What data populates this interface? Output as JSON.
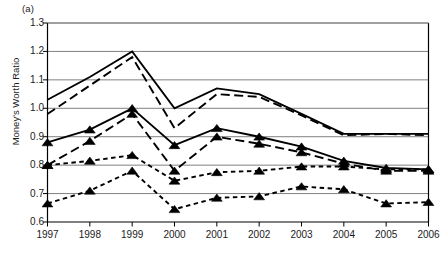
{
  "panel": {
    "label": "(a)"
  },
  "chart_data": {
    "type": "line",
    "title": "",
    "subtitle": "",
    "xlabel": "",
    "ylabel": "Money's Worth Ratio",
    "categories": [
      "1997",
      "1998",
      "1999",
      "2000",
      "2001",
      "2002",
      "2003",
      "2004",
      "2005",
      "2006"
    ],
    "x": [
      1997,
      1998,
      1999,
      2000,
      2001,
      2002,
      2003,
      2004,
      2005,
      2006
    ],
    "ylim": [
      0.6,
      1.3
    ],
    "yticks": [
      0.6,
      0.7,
      0.8,
      0.9,
      1.0,
      1.1,
      1.2,
      1.3
    ],
    "ytick_labels": [
      "0.6",
      "0.7",
      "0.8",
      "0.9",
      "1.0",
      "1.1",
      "1.2",
      "1.3"
    ],
    "xlim": [
      1997,
      2006
    ],
    "grid": "horizontal",
    "legend": "none",
    "line_color": "#000000",
    "grid_color": "#808080",
    "axis_color": "#000000",
    "series": [
      {
        "name": "series-1-top-solid",
        "style": "solid",
        "marker": "none",
        "values": [
          1.03,
          1.11,
          1.2,
          1.0,
          1.07,
          1.05,
          0.98,
          0.91,
          0.91,
          0.91
        ]
      },
      {
        "name": "series-2-top-longdash",
        "style": "long-dash",
        "marker": "none",
        "values": [
          0.98,
          1.08,
          1.18,
          0.93,
          1.05,
          1.04,
          0.975,
          0.905,
          0.91,
          0.905
        ]
      },
      {
        "name": "series-3-mid-solid",
        "style": "solid",
        "marker": "triangle",
        "values": [
          0.88,
          0.925,
          1.0,
          0.87,
          0.93,
          0.9,
          0.865,
          0.815,
          0.79,
          0.785
        ]
      },
      {
        "name": "series-4-mid-longdash",
        "style": "long-dash",
        "marker": "triangle",
        "values": [
          0.8,
          0.885,
          0.98,
          0.78,
          0.9,
          0.875,
          0.845,
          0.805,
          0.78,
          0.78
        ]
      },
      {
        "name": "series-5-shortdash-upper",
        "style": "short-dash",
        "marker": "triangle",
        "values": [
          0.8,
          0.815,
          0.835,
          0.745,
          0.775,
          0.78,
          0.795,
          0.795,
          0.785,
          0.785
        ]
      },
      {
        "name": "series-6-shortdash-lower",
        "style": "short-dash",
        "marker": "triangle",
        "values": [
          0.665,
          0.71,
          0.78,
          0.645,
          0.685,
          0.69,
          0.725,
          0.715,
          0.665,
          0.67
        ]
      }
    ]
  }
}
